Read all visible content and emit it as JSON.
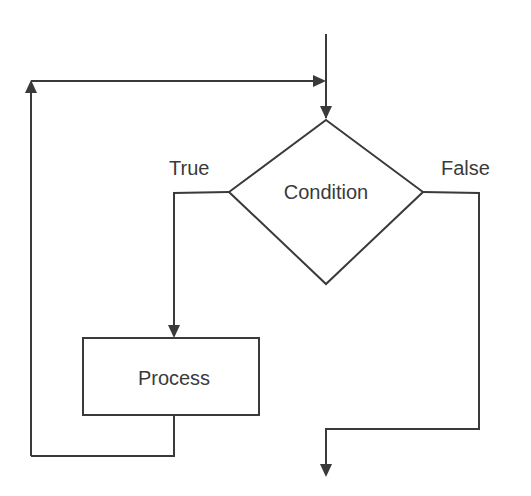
{
  "diagram": {
    "type": "flowchart",
    "title": "",
    "stroke_color": "#3a3a3a",
    "background": "#ffffff",
    "nodes": [
      {
        "id": "condition",
        "shape": "diamond",
        "label": "Condition",
        "cx": 326,
        "cy": 192,
        "w": 194,
        "h": 164
      },
      {
        "id": "process",
        "shape": "rectangle",
        "label": "Process",
        "x": 83,
        "y": 338,
        "w": 176,
        "h": 77
      }
    ],
    "edges": [
      {
        "from": "entry",
        "to": "condition",
        "label": ""
      },
      {
        "from": "condition",
        "to": "process",
        "label": "True"
      },
      {
        "from": "process",
        "to": "condition",
        "label": "",
        "note": "loop back"
      },
      {
        "from": "condition",
        "to": "exit",
        "label": "False"
      }
    ],
    "labels": {
      "condition": "Condition",
      "process": "Process",
      "true_branch": "True",
      "false_branch": "False"
    }
  }
}
